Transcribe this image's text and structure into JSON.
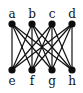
{
  "diagram": {
    "type": "graph",
    "name": "complete bipartite graph K4,4",
    "colors": {
      "node": "#0d0d0d",
      "edge": "#111111",
      "background": "#ffffff"
    },
    "nodes": [
      {
        "id": "a",
        "label": "a",
        "x": 12,
        "y": 24,
        "label_y": 18
      },
      {
        "id": "b",
        "label": "b",
        "x": 32,
        "y": 24,
        "label_y": 18
      },
      {
        "id": "c",
        "label": "c",
        "x": 52,
        "y": 24,
        "label_y": 18
      },
      {
        "id": "d",
        "label": "d",
        "x": 72,
        "y": 24,
        "label_y": 18
      },
      {
        "id": "e",
        "label": "e",
        "x": 12,
        "y": 70,
        "label_y": 85
      },
      {
        "id": "f",
        "label": "f",
        "x": 32,
        "y": 70,
        "label_y": 85
      },
      {
        "id": "g",
        "label": "g",
        "x": 52,
        "y": 70,
        "label_y": 85
      },
      {
        "id": "h",
        "label": "h",
        "x": 72,
        "y": 70,
        "label_y": 85
      }
    ],
    "edges": [
      [
        "a",
        "e"
      ],
      [
        "a",
        "f"
      ],
      [
        "a",
        "g"
      ],
      [
        "a",
        "h"
      ],
      [
        "b",
        "e"
      ],
      [
        "b",
        "f"
      ],
      [
        "b",
        "g"
      ],
      [
        "b",
        "h"
      ],
      [
        "c",
        "e"
      ],
      [
        "c",
        "f"
      ],
      [
        "c",
        "g"
      ],
      [
        "c",
        "h"
      ],
      [
        "d",
        "e"
      ],
      [
        "d",
        "f"
      ],
      [
        "d",
        "g"
      ],
      [
        "d",
        "h"
      ]
    ]
  }
}
